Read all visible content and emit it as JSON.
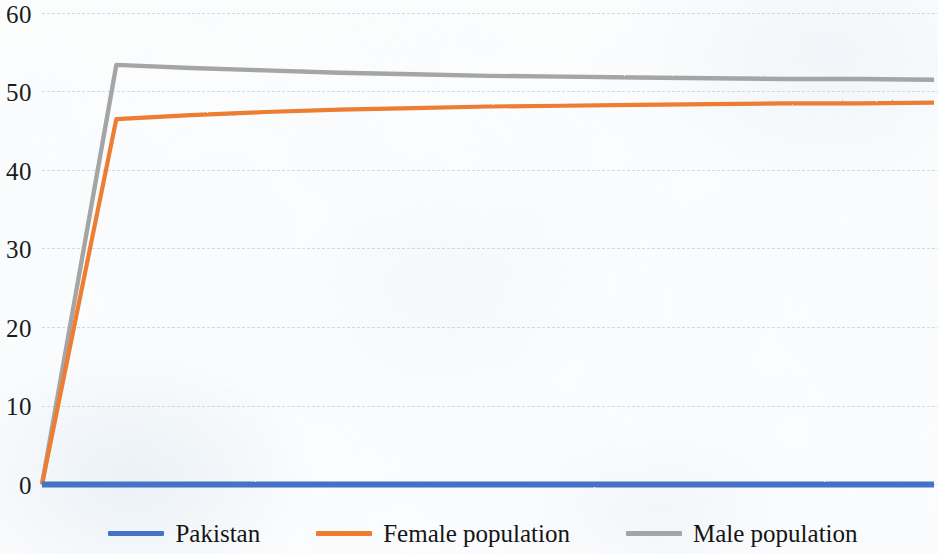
{
  "chart_data": {
    "type": "line",
    "title": "",
    "subtitle": "",
    "xlabel": "",
    "ylabel": "",
    "ylim": [
      0,
      60
    ],
    "ytick_labels": [
      "0",
      "10",
      "20",
      "30",
      "40",
      "50",
      "60"
    ],
    "ytick_values": [
      0,
      10,
      20,
      30,
      40,
      50,
      60
    ],
    "xtick_labels": [],
    "grid": true,
    "grid_axis": "y",
    "legend_position": "bottom",
    "x": [
      0,
      1,
      2,
      3,
      4,
      5,
      6,
      7,
      8,
      9,
      10,
      11,
      12
    ],
    "series": [
      {
        "name": "Pakistan",
        "color": "#4472C4",
        "values": [
          0,
          0,
          0,
          0,
          0,
          0,
          0,
          0,
          0,
          0,
          0,
          0,
          0
        ]
      },
      {
        "name": "Female population",
        "color": "#ED7D31",
        "values": [
          0,
          46.5,
          47.0,
          47.4,
          47.7,
          47.9,
          48.1,
          48.2,
          48.3,
          48.4,
          48.5,
          48.5,
          48.6
        ]
      },
      {
        "name": "Male population",
        "color": "#A5A5A5",
        "values": [
          0,
          53.4,
          53.0,
          52.7,
          52.4,
          52.2,
          52.0,
          51.9,
          51.8,
          51.7,
          51.6,
          51.6,
          51.5
        ]
      }
    ]
  },
  "legend": {
    "items": [
      {
        "label": "Pakistan",
        "color": "#4472C4",
        "swatch_name": "legend-swatch-pakistan"
      },
      {
        "label": "Female population",
        "color": "#ED7D31",
        "swatch_name": "legend-swatch-female-population"
      },
      {
        "label": "Male population",
        "color": "#A5A5A5",
        "swatch_name": "legend-swatch-male-population"
      }
    ]
  },
  "axis": {
    "y_ticks": [
      {
        "label": "60",
        "value": 60
      },
      {
        "label": "50",
        "value": 50
      },
      {
        "label": "40",
        "value": 40
      },
      {
        "label": "30",
        "value": 30
      },
      {
        "label": "20",
        "value": 20
      },
      {
        "label": "10",
        "value": 10
      },
      {
        "label": "0",
        "value": 0
      }
    ]
  },
  "colors": {
    "series_blue": "#4472C4",
    "series_orange": "#ED7D31",
    "series_gray": "#A5A5A5",
    "gridline": "#A8BACB",
    "text": "#1b1b1b",
    "background": "#fdfefe"
  }
}
